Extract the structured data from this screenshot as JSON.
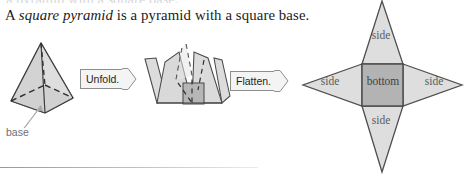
{
  "page": {
    "top_bleed_text": "a pyramid with a square base.",
    "heading": {
      "before": "A ",
      "italic": "square pyramid",
      "after": " is a pyramid with a square base."
    }
  },
  "figures": {
    "pyramid": {
      "name": "square-pyramid-solid",
      "callout_label": "base",
      "fill": "#d9d9d9",
      "stroke": "#4a4a4a",
      "hidden_edge_style": "dashed",
      "callout_color": "#6e6e72"
    },
    "unfolded": {
      "name": "partially-unfolded-pyramid",
      "fill": "#dcdcdc",
      "base_fill": "#b6b6b6",
      "stroke": "#4a4a4a"
    },
    "net": {
      "name": "pyramid-net-star",
      "bottom_label": "bottom",
      "side_labels": [
        "side",
        "side",
        "side",
        "side"
      ],
      "triangle_fill": "#dedede",
      "square_fill": "#b3b3b3",
      "stroke": "#4f4f4f"
    }
  },
  "buttons": {
    "unfold": {
      "label": "Unfold.",
      "icon": "arrow-right-icon"
    },
    "flatten": {
      "label": "Flatten.",
      "icon": "arrow-right-icon"
    }
  },
  "colors": {
    "page_background": "#ffffff",
    "text": "#1b1b1b",
    "figure_light_gray": "#dedede",
    "figure_mid_gray": "#b3b3b3",
    "figure_outline": "#4f4f4f",
    "button_face": "#f4f4f4",
    "button_border": "#8d8d8d",
    "rule": "#9a9a9e"
  }
}
